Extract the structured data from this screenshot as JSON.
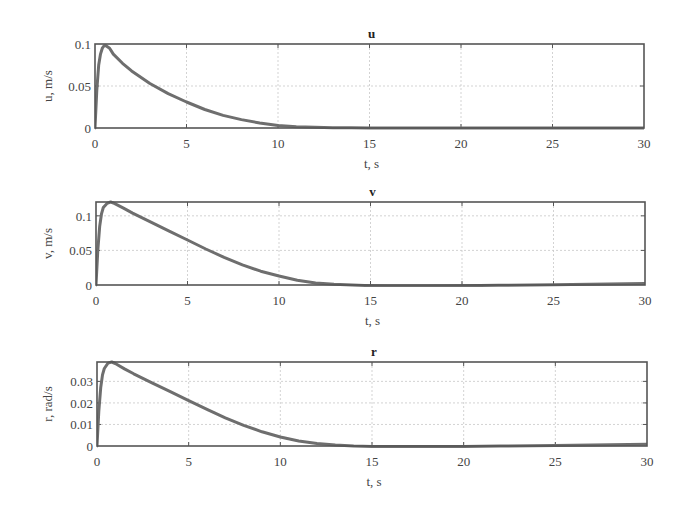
{
  "chart_data": [
    {
      "type": "line",
      "title": "u",
      "xlabel": "t, s",
      "ylabel": "u, m/s",
      "xlim": [
        0,
        30
      ],
      "ylim": [
        0,
        0.1
      ],
      "grid": true,
      "xticks": [
        "0",
        "5",
        "10",
        "15",
        "20",
        "25",
        "30"
      ],
      "yticks": [
        "0",
        "0.05",
        "0.1"
      ],
      "ytick_values": [
        0,
        0.05,
        0.1
      ],
      "series": [
        {
          "name": "u",
          "x": [
            0,
            0.1,
            0.2,
            0.3,
            0.4,
            0.5,
            0.6,
            0.8,
            1,
            1.5,
            2,
            3,
            4,
            5,
            6,
            7,
            8,
            9,
            10,
            11,
            12,
            13,
            14,
            15,
            17,
            20,
            25,
            30
          ],
          "y": [
            0,
            0.045,
            0.075,
            0.088,
            0.095,
            0.098,
            0.098,
            0.095,
            0.088,
            0.077,
            0.068,
            0.053,
            0.041,
            0.031,
            0.022,
            0.015,
            0.01,
            0.006,
            0.003,
            0.0015,
            0.0008,
            0.0004,
            0.0002,
            0.0001,
            0.0,
            0.0,
            0.0,
            0.0
          ]
        }
      ]
    },
    {
      "type": "line",
      "title": "v",
      "xlabel": "t, s",
      "ylabel": "v, m/s",
      "xlim": [
        0,
        30
      ],
      "ylim": [
        0,
        0.12
      ],
      "grid": true,
      "xticks": [
        "0",
        "5",
        "10",
        "15",
        "20",
        "25",
        "30"
      ],
      "yticks": [
        "0",
        "0.05",
        "0.1"
      ],
      "ytick_values": [
        0,
        0.05,
        0.1
      ],
      "series": [
        {
          "name": "v",
          "x": [
            0,
            0.1,
            0.2,
            0.3,
            0.4,
            0.6,
            0.8,
            1,
            1.5,
            2,
            3,
            4,
            5,
            6,
            7,
            8,
            9,
            10,
            11,
            12,
            13,
            14,
            15,
            16,
            18,
            20,
            22,
            25,
            28,
            30
          ],
          "y": [
            0,
            0.05,
            0.085,
            0.103,
            0.112,
            0.118,
            0.12,
            0.118,
            0.111,
            0.104,
            0.091,
            0.078,
            0.065,
            0.052,
            0.04,
            0.029,
            0.02,
            0.013,
            0.007,
            0.003,
            0.001,
            0.0,
            -0.001,
            -0.0015,
            -0.0015,
            -0.001,
            -0.0005,
            0.0005,
            0.0015,
            0.002
          ]
        }
      ]
    },
    {
      "type": "line",
      "title": "r",
      "xlabel": "t, s",
      "ylabel": "r, rad/s",
      "xlim": [
        0,
        30
      ],
      "ylim": [
        0,
        0.039
      ],
      "grid": true,
      "xticks": [
        "0",
        "5",
        "10",
        "15",
        "20",
        "25",
        "30"
      ],
      "yticks": [
        "0",
        "0.01",
        "0.02",
        "0.03"
      ],
      "ytick_values": [
        0,
        0.01,
        0.02,
        0.03
      ],
      "series": [
        {
          "name": "r",
          "x": [
            0,
            0.1,
            0.2,
            0.3,
            0.4,
            0.6,
            0.8,
            1,
            1.5,
            2,
            3,
            4,
            5,
            6,
            7,
            8,
            9,
            10,
            11,
            12,
            13,
            14,
            15,
            16,
            18,
            20,
            22,
            25,
            28,
            30
          ],
          "y": [
            0,
            0.016,
            0.027,
            0.033,
            0.036,
            0.0385,
            0.039,
            0.0383,
            0.0358,
            0.0335,
            0.0293,
            0.0252,
            0.0211,
            0.017,
            0.0131,
            0.0096,
            0.0066,
            0.0042,
            0.0023,
            0.0011,
            0.0004,
            0.0,
            -0.0002,
            -0.0003,
            -0.0003,
            -0.0002,
            0.0,
            0.0003,
            0.0006,
            0.0008
          ]
        }
      ]
    }
  ]
}
